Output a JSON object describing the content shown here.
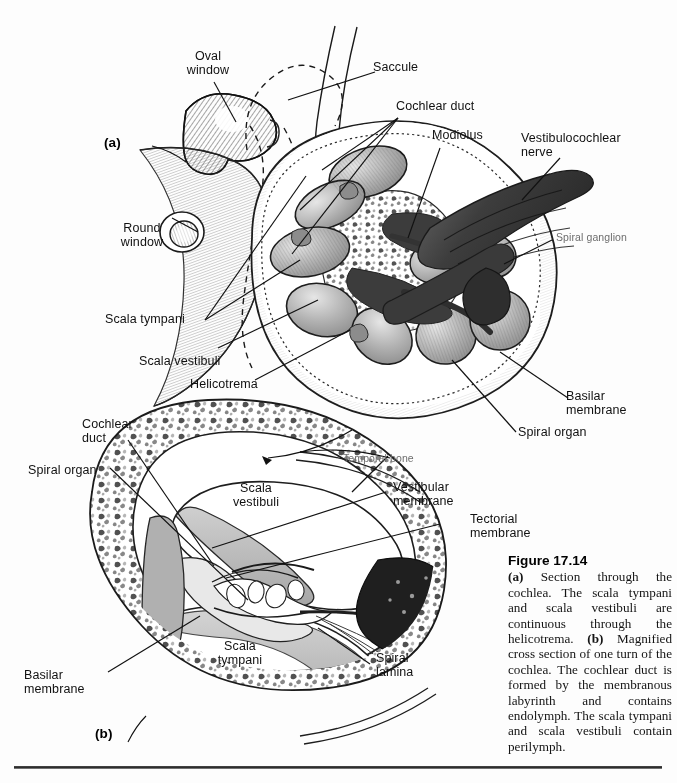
{
  "figure": {
    "number": "Figure 17.14",
    "caption_a_marker": "(a)",
    "caption_a_text": " Section through the cochlea. The scala tympani and scala vestibuli are continuous through the helicotrema. ",
    "caption_b_marker": "(b)",
    "caption_b_text": " Magnified cross section of one turn of the cochlea. The cochlear duct is formed by the membranous labyrinth and contains endolymph. The scala tympani and scala vestibuli contain perilymph."
  },
  "panels": {
    "a_marker": "(a)",
    "b_marker": "(b)"
  },
  "panel_a_labels": [
    {
      "id": "oval-window",
      "text": "Oval\nwindow"
    },
    {
      "id": "saccule",
      "text": "Saccule"
    },
    {
      "id": "cochlear-duct",
      "text": "Cochlear duct"
    },
    {
      "id": "modiolus",
      "text": "Modiolus"
    },
    {
      "id": "vestibulocochlear-nerve",
      "text": "Vestibulocochlear\nnerve"
    },
    {
      "id": "spiral-ganglion",
      "text": "Spiral ganglion"
    },
    {
      "id": "round-window",
      "text": "Round\nwindow"
    },
    {
      "id": "scala-tympani",
      "text": "Scala tympani"
    },
    {
      "id": "scala-vestibuli",
      "text": "Scala vestibuli"
    },
    {
      "id": "helicotrema",
      "text": "Helicotrema"
    },
    {
      "id": "basilar-membrane-a",
      "text": "Basilar\nmembrane"
    },
    {
      "id": "spiral-organ-a",
      "text": "Spiral organ"
    }
  ],
  "panel_b_labels": [
    {
      "id": "cochlear-duct-b",
      "text": "Cochlear\nduct"
    },
    {
      "id": "spiral-organ-b",
      "text": "Spiral organ"
    },
    {
      "id": "temporal-bone",
      "text": "Temporal bone"
    },
    {
      "id": "scala-vestibuli-b",
      "text": "Scala\nvestibuli"
    },
    {
      "id": "vestibular-membrane",
      "text": "Vestibular\nmembrane"
    },
    {
      "id": "tectorial-membrane",
      "text": "Tectorial\nmembrane"
    },
    {
      "id": "scala-tympani-b",
      "text": "Scala\ntympani"
    },
    {
      "id": "spiral-lamina",
      "text": "Spiral\nlamina"
    },
    {
      "id": "basilar-membrane-b",
      "text": "Basilar\nmembrane"
    }
  ],
  "colors": {
    "ink": "#111111",
    "muted_label": "#6d6d6d",
    "tissue_gray": "#a9a9a9",
    "tissue_light": "#cfcfcf",
    "nerve_dark": "#4a4a4a",
    "ganglion_black": "#2a2a2a",
    "rule": "#2b2b2b",
    "background": "#fdfdfd"
  }
}
